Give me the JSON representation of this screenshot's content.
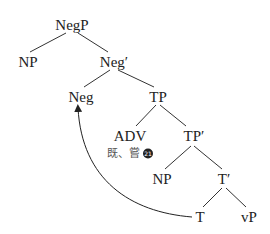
{
  "diagram": {
    "type": "syntax-tree",
    "nodes": {
      "negp": {
        "label": "NegP",
        "x": 72,
        "y": 25
      },
      "np1": {
        "label": "NP",
        "x": 28,
        "y": 62
      },
      "negbar": {
        "label": "Neg′",
        "x": 114,
        "y": 62
      },
      "neg": {
        "label": "Neg",
        "x": 81,
        "y": 97
      },
      "tp": {
        "label": "TP",
        "x": 158,
        "y": 97
      },
      "adv": {
        "label": "ADV",
        "x": 130,
        "y": 136
      },
      "tpbar": {
        "label": "TP′",
        "x": 194,
        "y": 136
      },
      "np2": {
        "label": "NP",
        "x": 162,
        "y": 179
      },
      "tbar": {
        "label": "T′",
        "x": 224,
        "y": 179
      },
      "t": {
        "label": "T",
        "x": 200,
        "y": 217
      },
      "vp": {
        "label": "vP",
        "x": 249,
        "y": 217
      }
    },
    "adv_lexical": {
      "text": "既、嘗",
      "note_number": "21"
    },
    "edges": [
      [
        "negp",
        "np1"
      ],
      [
        "negp",
        "negbar"
      ],
      [
        "negbar",
        "neg"
      ],
      [
        "negbar",
        "tp"
      ],
      [
        "tp",
        "adv"
      ],
      [
        "tp",
        "tpbar"
      ],
      [
        "tpbar",
        "np2"
      ],
      [
        "tpbar",
        "tbar"
      ],
      [
        "tbar",
        "t"
      ],
      [
        "tbar",
        "vp"
      ]
    ],
    "movement_arrow": {
      "from": "T",
      "to": "Neg"
    }
  }
}
